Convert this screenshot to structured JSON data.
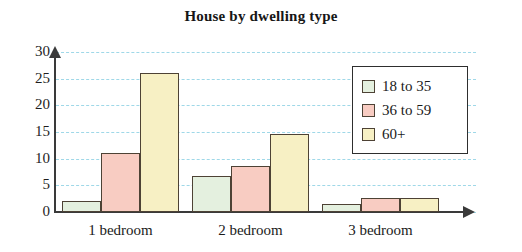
{
  "chart_data": {
    "type": "bar",
    "title": "House by dwelling type",
    "xlabel": "",
    "ylabel": "",
    "categories": [
      "1 bedroom",
      "2 bedroom",
      "3 bedroom"
    ],
    "series": [
      {
        "name": "18 to 35",
        "color": "#e4f0df",
        "values": [
          2,
          6.8,
          1.5
        ]
      },
      {
        "name": "36 to 59",
        "color": "#f8ccc2",
        "values": [
          11,
          8.7,
          2.7
        ]
      },
      {
        "name": "60+",
        "color": "#f7f0c4",
        "values": [
          26,
          14.7,
          2.7
        ]
      }
    ],
    "ylim": [
      0,
      30
    ],
    "yticks": [
      0,
      5,
      10,
      15,
      20,
      25,
      30
    ],
    "ytick_labels": [
      "0",
      "5",
      "10",
      "15",
      "20",
      "25",
      "30"
    ],
    "grid": true,
    "grid_color": "#9fd8e8",
    "grid_style": "dashed",
    "legend_position": "top-right",
    "axis_color": "#3a3a3a",
    "bar_border_color": "#4d4235",
    "background": "#ffffff"
  }
}
